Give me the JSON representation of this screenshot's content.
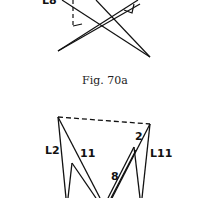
{
  "figure_top": {
    "partial_label": "L8"
  },
  "caption": "Fig. 70a",
  "figure_bottom": {
    "labels": {
      "left_outer": "L2",
      "left_inner": "11",
      "right_top": "2",
      "right_outer": "L11",
      "right_inner": "8"
    }
  },
  "colors": {
    "ink": "#111111",
    "background": "#ffffff"
  }
}
